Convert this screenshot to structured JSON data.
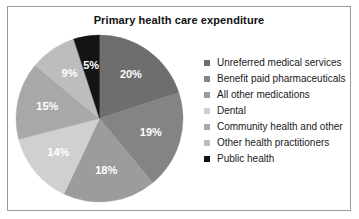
{
  "chart_data": {
    "type": "pie",
    "title": "Primary health care expenditure",
    "xlabel": "",
    "ylabel": "",
    "legend_position": "right",
    "grid": false,
    "categories": [
      "Unreferred medical services",
      "Benefit paid pharmaceuticals",
      "All other medications",
      "Dental",
      "Community health and other",
      "Other health practitioners",
      "Public health"
    ],
    "values": [
      20,
      19,
      18,
      14,
      15,
      9,
      5
    ],
    "value_labels": [
      "20%",
      "19%",
      "18%",
      "14%",
      "15%",
      "9%",
      "5%"
    ],
    "colors": [
      "#6e6e6e",
      "#848484",
      "#9c9c9c",
      "#d0d0d0",
      "#a8a8a8",
      "#bdbdbd",
      "#141414"
    ],
    "start_angle_deg": 0,
    "direction": "clockwise"
  },
  "legend": {
    "items": [
      {
        "label": "Unreferred medical services",
        "color": "#6e6e6e"
      },
      {
        "label": "Benefit paid pharmaceuticals",
        "color": "#848484"
      },
      {
        "label": "All other medications",
        "color": "#9c9c9c"
      },
      {
        "label": "Dental",
        "color": "#d0d0d0"
      },
      {
        "label": "Community health and other",
        "color": "#a8a8a8"
      },
      {
        "label": "Other health practitioners",
        "color": "#bdbdbd"
      },
      {
        "label": "Public health",
        "color": "#141414"
      }
    ]
  },
  "frame": {
    "border_color": "#9a9a9a",
    "background": "#ffffff"
  }
}
